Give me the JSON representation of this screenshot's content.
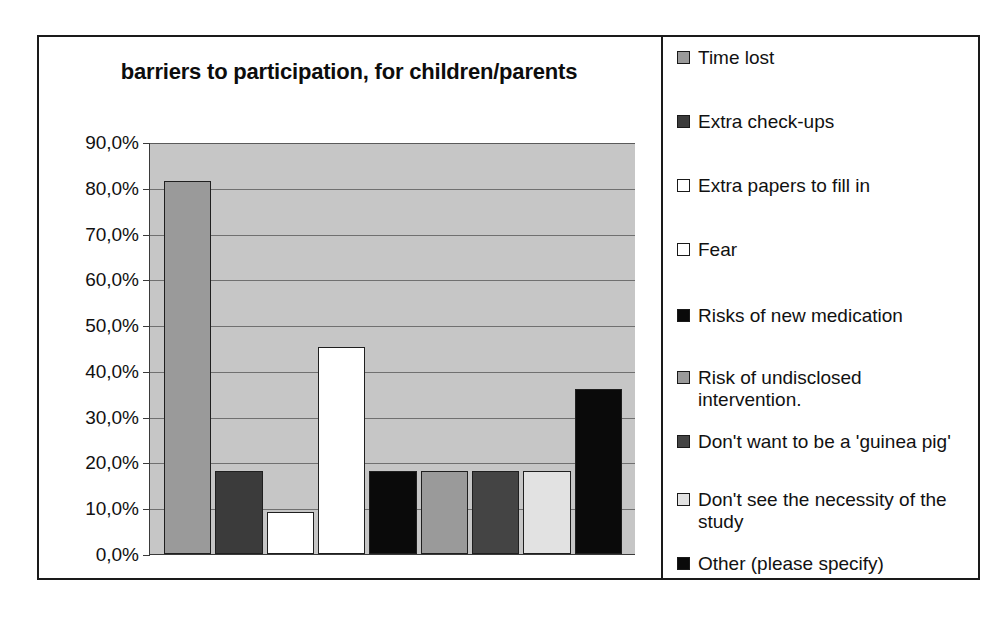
{
  "chart_data": {
    "type": "bar",
    "title": "barriers to participation, for children/parents",
    "xlabel": "",
    "ylabel": "",
    "ylim": [
      0,
      90
    ],
    "ytick_labels": [
      "90,0%",
      "80,0%",
      "70,0%",
      "60,0%",
      "50,0%",
      "40,0%",
      "30,0%",
      "20,0%",
      "10,0%",
      "0,0%"
    ],
    "ytick_values": [
      90,
      80,
      70,
      60,
      50,
      40,
      30,
      20,
      10,
      0
    ],
    "grid": true,
    "legend_position": "right",
    "categories": [
      "Time lost",
      "Extra check-ups",
      "Extra papers to fill in",
      "Fear",
      "Risks of new medication",
      "Risk of undisclosed intervention.",
      "Don't want to be a 'guinea pig'",
      "Don't see the necessity of the study",
      "Other (please specify)"
    ],
    "values": [
      81.5,
      18.2,
      9.1,
      45.2,
      18.2,
      18.2,
      18.2,
      18.2,
      36.0
    ],
    "value_labels": [
      "81,5%",
      "18,2%",
      "9,1%",
      "45,2%",
      "18,2%",
      "18,2%",
      "18,2%",
      "18,2%",
      "36,0%"
    ],
    "colors": [
      "#9a9a9a",
      "#3b3b3b",
      "#ffffff",
      "#ffffff",
      "#0a0a0a",
      "#9a9a9a",
      "#444444",
      "#e2e2e2",
      "#0a0a0a"
    ],
    "plot_background": "#c6c6c6",
    "frame_color": "#1a1a1a",
    "gridline_color": "#707070"
  },
  "legend": {
    "entries": [
      {
        "label": "Time lost",
        "color": "#9a9a9a"
      },
      {
        "label": "Extra check-ups",
        "color": "#3b3b3b"
      },
      {
        "label": "Extra papers to fill in",
        "color": "#ffffff"
      },
      {
        "label": "Fear",
        "color": "#ffffff"
      },
      {
        "label": "Risks of new medication",
        "color": "#0a0a0a"
      },
      {
        "label": "Risk of undisclosed\nintervention.",
        "color": "#9a9a9a"
      },
      {
        "label": "Don't want to be a 'guinea pig'",
        "color": "#444444"
      },
      {
        "label": "Don't see the necessity of the\nstudy",
        "color": "#e2e2e2"
      },
      {
        "label": "Other (please specify)",
        "color": "#0a0a0a"
      }
    ]
  }
}
